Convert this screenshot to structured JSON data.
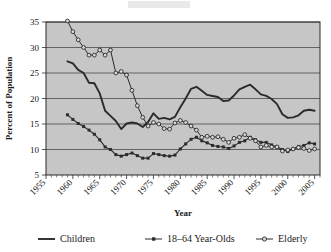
{
  "chart_data": {
    "type": "line",
    "title": "",
    "xlabel": "Year",
    "ylabel": "Percent of Population",
    "xlim": [
      1955,
      2006
    ],
    "ylim": [
      5,
      35
    ],
    "grid": true,
    "legend_position": "bottom",
    "xticks": [
      "1955",
      "1960",
      "1965",
      "1970",
      "1975",
      "1980",
      "1985",
      "1990",
      "1995",
      "2000",
      "2005"
    ],
    "yticks": [
      "5",
      "10",
      "15",
      "20",
      "25",
      "30",
      "35"
    ],
    "x": [
      1959,
      1960,
      1961,
      1962,
      1963,
      1964,
      1965,
      1966,
      1967,
      1968,
      1969,
      1970,
      1971,
      1972,
      1973,
      1974,
      1975,
      1976,
      1977,
      1978,
      1979,
      1980,
      1981,
      1982,
      1983,
      1984,
      1985,
      1986,
      1987,
      1988,
      1989,
      1990,
      1991,
      1992,
      1993,
      1994,
      1995,
      1996,
      1997,
      1998,
      1999,
      2000,
      2001,
      2002,
      2003,
      2004,
      2005
    ],
    "series": [
      {
        "name": "Children",
        "marker": "none",
        "values": [
          27.3,
          26.9,
          25.6,
          25.0,
          23.1,
          23.0,
          21.0,
          17.6,
          16.6,
          15.6,
          14.0,
          15.1,
          15.3,
          15.1,
          14.4,
          15.4,
          17.1,
          16.0,
          16.2,
          15.9,
          16.4,
          18.3,
          20.0,
          21.9,
          22.3,
          21.5,
          20.7,
          20.5,
          20.3,
          19.5,
          19.6,
          20.6,
          21.8,
          22.3,
          22.7,
          21.8,
          20.8,
          20.5,
          19.9,
          18.9,
          16.9,
          16.2,
          16.3,
          16.7,
          17.6,
          17.8,
          17.6
        ],
        "color": "#2b2b2b"
      },
      {
        "name": "18–64 Year-Olds",
        "marker": "square-filled",
        "values": [
          16.8,
          15.9,
          15.1,
          14.5,
          13.8,
          13.0,
          11.9,
          10.5,
          10.0,
          9.0,
          8.7,
          9.0,
          9.3,
          8.8,
          8.3,
          8.3,
          9.2,
          9.0,
          8.8,
          8.7,
          8.9,
          10.1,
          11.1,
          12.0,
          12.4,
          11.7,
          11.3,
          10.8,
          10.6,
          10.5,
          10.2,
          10.7,
          11.4,
          11.7,
          12.4,
          11.9,
          11.4,
          11.4,
          10.9,
          10.5,
          10.0,
          9.6,
          10.1,
          10.6,
          10.8,
          11.3,
          11.1
        ],
        "color": "#2b2b2b"
      },
      {
        "name": "Elderly",
        "marker": "circle-open",
        "values": [
          35.2,
          33.1,
          31.5,
          30.0,
          28.5,
          28.5,
          29.5,
          28.5,
          29.5,
          25.0,
          25.3,
          24.6,
          21.6,
          18.6,
          16.3,
          14.6,
          15.3,
          15.0,
          14.1,
          14.0,
          15.2,
          15.7,
          15.3,
          14.6,
          13.8,
          12.4,
          12.6,
          12.4,
          12.5,
          12.0,
          11.4,
          12.2,
          12.4,
          12.9,
          12.2,
          11.7,
          10.5,
          10.8,
          10.5,
          10.5,
          9.7,
          9.9,
          10.1,
          10.4,
          10.2,
          9.8,
          10.1
        ],
        "color": "#2b2b2b"
      }
    ]
  },
  "legend": {
    "items": [
      {
        "label": "Children",
        "marker": "solid-line"
      },
      {
        "label": "18–64 Year-Olds",
        "marker": "line-with-filled-square"
      },
      {
        "label": "Elderly",
        "marker": "line-with-open-circle"
      }
    ]
  }
}
